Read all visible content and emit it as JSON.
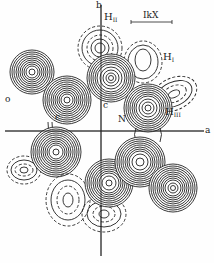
{
  "figure": {
    "type": "electron density contour map",
    "axes": {
      "horizontal": "a",
      "vertical": "b"
    },
    "scale_bar": {
      "label": "IkX"
    },
    "labels": {
      "h2": "H",
      "h2_sub": "II",
      "h1": "H",
      "h1_sub": "I",
      "h3": "H",
      "h3_sub": "III",
      "oxygen": "o",
      "carbon_left": "c",
      "carbon_center": "c",
      "nitrogen": "N"
    },
    "atoms": [
      {
        "id": "O",
        "cx": 32,
        "cy": 72,
        "r": 22,
        "style": "solid"
      },
      {
        "id": "C1",
        "cx": 67,
        "cy": 100,
        "r": 24,
        "style": "solid"
      },
      {
        "id": "C2",
        "cx": 111,
        "cy": 78,
        "r": 24,
        "style": "solid"
      },
      {
        "id": "N",
        "cx": 148,
        "cy": 108,
        "r": 24,
        "style": "solid"
      },
      {
        "id": "HII",
        "cx": 100,
        "cy": 48,
        "r": 21,
        "style": "dashed"
      },
      {
        "id": "HI",
        "cx": 143,
        "cy": 60,
        "r": 18,
        "style": "dashed"
      },
      {
        "id": "HIII",
        "cx": 172,
        "cy": 95,
        "r": 20,
        "style": "dashed"
      },
      {
        "id": "B1",
        "cx": 56,
        "cy": 152,
        "r": 25,
        "style": "solid"
      },
      {
        "id": "B2",
        "cx": 109,
        "cy": 183,
        "r": 24,
        "style": "solid"
      },
      {
        "id": "B3",
        "cx": 140,
        "cy": 162,
        "r": 25,
        "style": "solid"
      },
      {
        "id": "B4",
        "cx": 173,
        "cy": 188,
        "r": 24,
        "style": "solid"
      },
      {
        "id": "BH1",
        "cx": 24,
        "cy": 170,
        "r": 17,
        "style": "dashed"
      },
      {
        "id": "BH2",
        "cx": 68,
        "cy": 200,
        "r": 20,
        "style": "dashed"
      },
      {
        "id": "BH3",
        "cx": 104,
        "cy": 213,
        "r": 20,
        "style": "dashed"
      }
    ]
  }
}
